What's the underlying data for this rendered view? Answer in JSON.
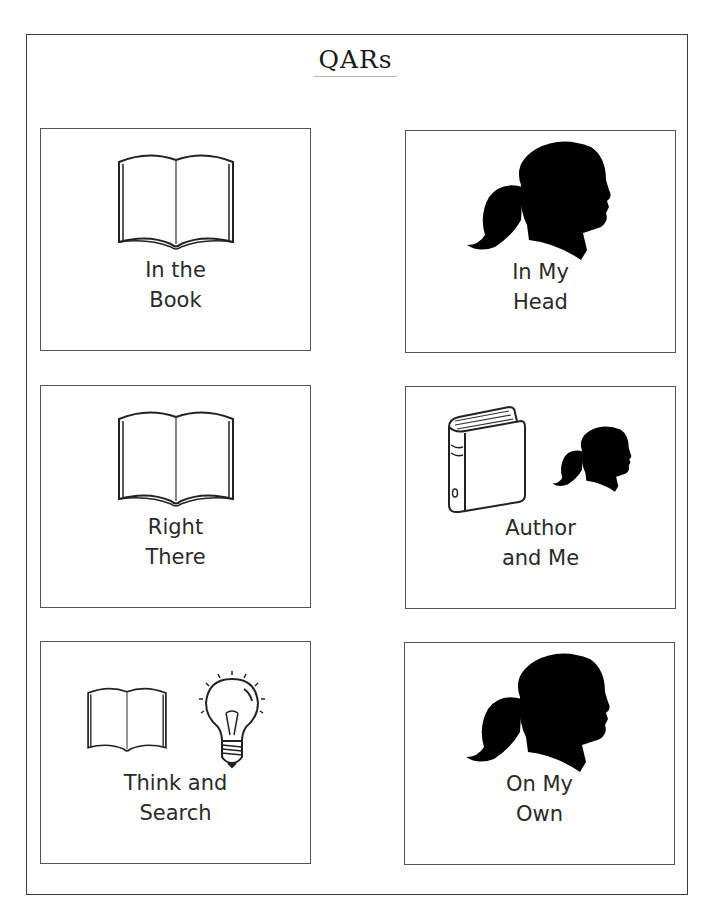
{
  "page": {
    "title": "QARs"
  },
  "cards": [
    {
      "id": "in-the-book",
      "line1": "In the",
      "line2": "Book",
      "icons": [
        "open-book-icon"
      ]
    },
    {
      "id": "in-my-head",
      "line1": "In My",
      "line2": "Head",
      "icons": [
        "head-silhouette-icon"
      ]
    },
    {
      "id": "right-there",
      "line1": "Right",
      "line2": "There",
      "icons": [
        "open-book-icon"
      ]
    },
    {
      "id": "author-and-me",
      "line1": "Author",
      "line2": "and Me",
      "icons": [
        "closed-book-icon",
        "head-silhouette-icon"
      ]
    },
    {
      "id": "think-and-search",
      "line1": "Think and",
      "line2": "Search",
      "icons": [
        "open-book-icon",
        "light-bulb-icon"
      ]
    },
    {
      "id": "on-my-own",
      "line1": "On My",
      "line2": "Own",
      "icons": [
        "head-silhouette-icon"
      ]
    }
  ],
  "colors": {
    "ink": "#1a1a1a",
    "border": "#555555",
    "background": "#ffffff"
  }
}
